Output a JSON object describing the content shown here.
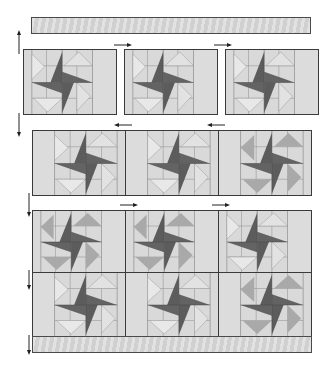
{
  "diagram": {
    "type": "quilt-assembly",
    "colors": {
      "background_fabric": "#d9d9d9",
      "light_triangle": "#e6e6e6",
      "medium_triangle": "#a9a9a9",
      "dark_pinwheel": "#5e5e5e",
      "outline": "#3a3a3a",
      "seam": "#8a8a8a"
    },
    "top_border": {
      "label": "border strip"
    },
    "bottom_border": {
      "label": "border strip"
    },
    "rows": [
      {
        "index": 1,
        "joined": false,
        "pressing": "right",
        "blocks": 3,
        "side_arrow": "up"
      },
      {
        "index": 2,
        "joined": true,
        "pressing": "left",
        "blocks": 3,
        "side_arrow": "down"
      },
      {
        "index": 3,
        "joined": true,
        "pressing": "right",
        "blocks": 3,
        "side_arrow": "down"
      },
      {
        "index": 4,
        "joined": true,
        "pressing": "left",
        "blocks": 3,
        "side_arrow": "down"
      }
    ]
  }
}
